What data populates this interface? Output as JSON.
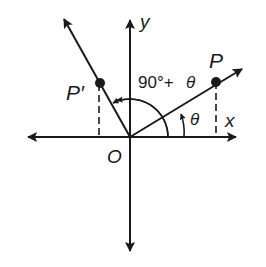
{
  "diagram": {
    "labels": {
      "y_axis": "y",
      "x_axis": "x",
      "origin": "O",
      "point_p": "P",
      "point_p_prime": "P′",
      "big_angle_number": "90°+",
      "big_angle_theta": "θ",
      "small_angle": "θ"
    },
    "colors": {
      "stroke": "#1a1a1a",
      "background": "#ffffff"
    }
  }
}
